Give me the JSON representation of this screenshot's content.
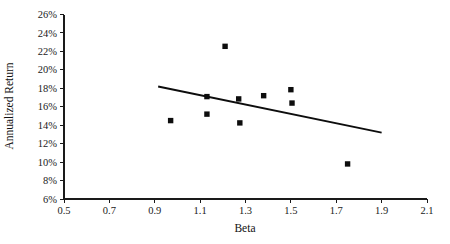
{
  "chart_data": {
    "type": "scatter",
    "title": "",
    "xlabel": "Beta",
    "ylabel": "Annualized Return",
    "xlim": [
      0.5,
      2.1
    ],
    "ylim": [
      6,
      26
    ],
    "x_ticks": [
      0.5,
      0.7,
      0.9,
      1.1,
      1.3,
      1.5,
      1.7,
      1.9,
      2.1
    ],
    "x_tick_labels": [
      "0.5",
      "0.7",
      "0.9",
      "1.1",
      "1.3",
      "1.5",
      "1.7",
      "1.9",
      "2.1"
    ],
    "y_ticks": [
      6,
      8,
      10,
      12,
      14,
      16,
      18,
      20,
      22,
      24,
      26
    ],
    "y_tick_labels": [
      "6%",
      "8%",
      "10%",
      "12%",
      "14%",
      "16%",
      "18%",
      "20%",
      "22%",
      "24%",
      "26%"
    ],
    "grid": false,
    "legend": null,
    "marker_style": "filled-square",
    "marker_color": "#0d0d0d",
    "points": [
      {
        "x": 0.97,
        "y": 14.5
      },
      {
        "x": 1.13,
        "y": 17.1
      },
      {
        "x": 1.13,
        "y": 15.2
      },
      {
        "x": 1.21,
        "y": 22.55
      },
      {
        "x": 1.27,
        "y": 16.85
      },
      {
        "x": 1.275,
        "y": 14.25
      },
      {
        "x": 1.38,
        "y": 17.2
      },
      {
        "x": 1.5,
        "y": 17.85
      },
      {
        "x": 1.505,
        "y": 16.4
      },
      {
        "x": 1.75,
        "y": 9.8
      }
    ],
    "trendline": {
      "type": "linear-fit",
      "x_start": 0.915,
      "y_start": 18.2,
      "x_end": 1.9,
      "y_end": 13.2,
      "color": "#0d0d0d"
    }
  }
}
